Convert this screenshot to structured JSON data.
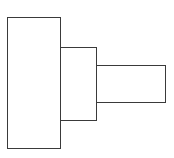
{
  "diagram": {
    "type": "stepped-rectangles",
    "stroke_color": "#3a3a3a",
    "fill_color": "#ffffff",
    "shapes": [
      {
        "name": "large-rectangle",
        "x": 7,
        "y": 17,
        "w": 54,
        "h": 132
      },
      {
        "name": "medium-rectangle",
        "x": 60,
        "y": 47,
        "w": 37,
        "h": 74
      },
      {
        "name": "small-rectangle",
        "x": 96,
        "y": 65,
        "w": 70,
        "h": 38
      }
    ]
  }
}
